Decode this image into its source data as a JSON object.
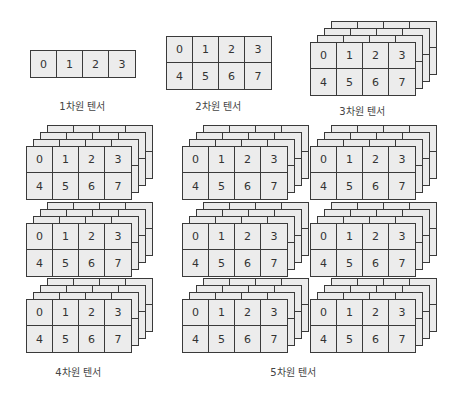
{
  "colors": {
    "cell_fill": "#ececec",
    "cell_border": "#3a3a3a",
    "text": "#333333",
    "background": "#ffffff"
  },
  "tensor_values": {
    "row1": [
      "0",
      "1",
      "2",
      "3"
    ],
    "row2": [
      "4",
      "5",
      "6",
      "7"
    ]
  },
  "diagrams": [
    {
      "id": "tensor-1d",
      "label": "1차원 텐서",
      "dims": 1
    },
    {
      "id": "tensor-2d",
      "label": "2차원 텐서",
      "dims": 2
    },
    {
      "id": "tensor-3d",
      "label": "3차원 텐서",
      "dims": 3,
      "depth_layers": 4
    },
    {
      "id": "tensor-4d",
      "label": "4차원 텐서",
      "dims": 4,
      "stack_count": 3,
      "depth_layers": 4
    },
    {
      "id": "tensor-5d",
      "label": "5차원 텐서",
      "dims": 5,
      "stack_columns": 2,
      "stack_count": 3,
      "depth_layers": 4
    }
  ]
}
